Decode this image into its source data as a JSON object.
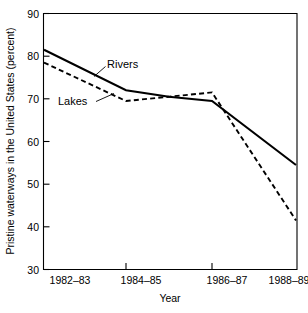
{
  "chart_data": {
    "type": "line",
    "title": "",
    "subtitle": "",
    "xlabel": "Year",
    "ylabel": "Pristine waterways in the United States (percent)",
    "categories": [
      "1982–83",
      "1984–85",
      "1986–87",
      "1988–89"
    ],
    "x_tick_labels": [
      "1982–83",
      "1984–85",
      "1986–87",
      "1988–89"
    ],
    "y_tick_labels": [
      "30",
      "40",
      "50",
      "60",
      "70",
      "80",
      "90"
    ],
    "y_ticks": [
      30,
      40,
      50,
      60,
      70,
      80,
      90
    ],
    "ylim": [
      30,
      90
    ],
    "grid": false,
    "legend_position": "inline-annotation",
    "series": [
      {
        "name": "Rivers",
        "style": "solid",
        "color": "#000000",
        "x": [
          "1982–83",
          "1984–85",
          "1985–86",
          "1986–87",
          "1988–89"
        ],
        "values": [
          81.5,
          72.0,
          70.5,
          69.5,
          54.5
        ]
      },
      {
        "name": "Lakes",
        "style": "dashed",
        "color": "#000000",
        "x": [
          "1982–83",
          "1984–85",
          "1985–86",
          "1986–87",
          "1988–89"
        ],
        "values": [
          78.5,
          69.5,
          70.5,
          71.5,
          41.5
        ]
      }
    ],
    "annotations": [
      {
        "text": "Rivers",
        "target_series": "Rivers"
      },
      {
        "text": "Lakes",
        "target_series": "Lakes"
      }
    ]
  }
}
